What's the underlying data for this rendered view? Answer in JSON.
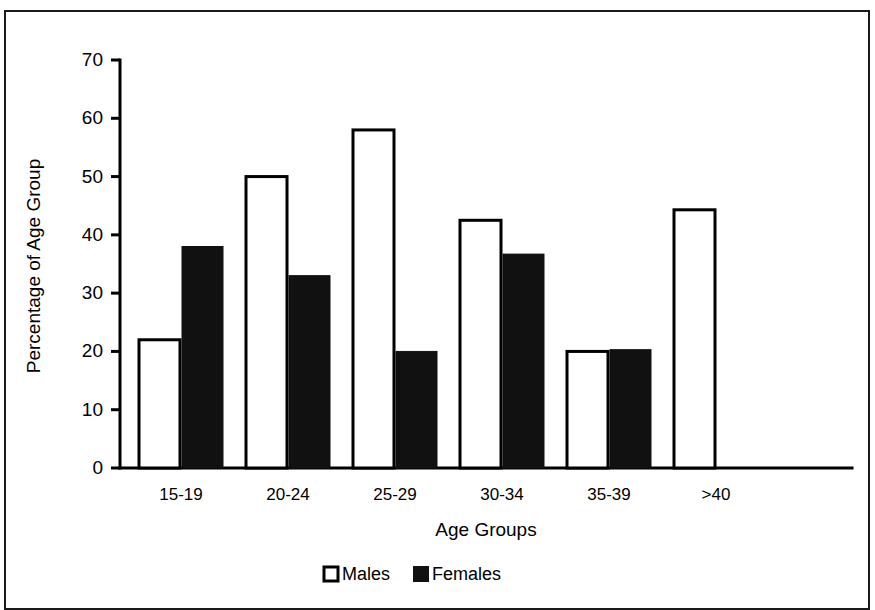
{
  "chart_data": {
    "type": "bar",
    "title": "",
    "xlabel": "Age Groups",
    "ylabel": "Percentage of Age Group",
    "categories": [
      "15-19",
      "20-24",
      "25-29",
      "30-34",
      "35-39",
      ">40"
    ],
    "series": [
      {
        "name": "Males",
        "values": [
          22,
          50,
          58,
          42.5,
          20,
          44.3
        ],
        "style": "open",
        "color": "#ffffff"
      },
      {
        "name": "Females",
        "values": [
          38,
          33,
          20,
          36.7,
          20.3,
          0
        ],
        "style": "filled",
        "color": "#111111"
      }
    ],
    "ylim": [
      0,
      70
    ],
    "yticks": [
      0,
      10,
      20,
      30,
      40,
      50,
      60,
      70
    ],
    "ytick_labels": [
      "0",
      "10",
      "20",
      "30",
      "40",
      "50",
      "60",
      "70"
    ],
    "grid": false,
    "legend_position": "bottom",
    "legend": [
      {
        "label": "Males",
        "swatch": "open-square"
      },
      {
        "label": "Females",
        "swatch": "filled-square"
      }
    ]
  },
  "figure": {
    "border_color": "#1a1a1a",
    "background": "#ffffff"
  }
}
